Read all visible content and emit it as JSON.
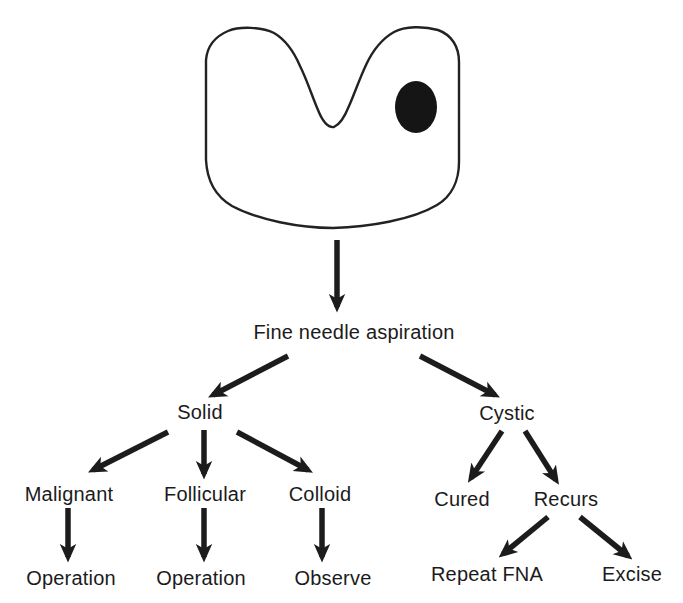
{
  "figure": {
    "shape": "thyroid-gland-with-nodule",
    "nodes": {
      "fna": "Fine needle aspiration",
      "solid": "Solid",
      "cystic": "Cystic",
      "malignant": "Malignant",
      "follicular": "Follicular",
      "colloid": "Colloid",
      "cured": "Cured",
      "recurs": "Recurs",
      "operation1": "Operation",
      "operation2": "Operation",
      "observe": "Observe",
      "repeat_fna": "Repeat FNA",
      "excise": "Excise"
    },
    "edges": [
      {
        "from": "thyroid",
        "to": "fna"
      },
      {
        "from": "fna",
        "to": "solid"
      },
      {
        "from": "fna",
        "to": "cystic"
      },
      {
        "from": "solid",
        "to": "malignant"
      },
      {
        "from": "solid",
        "to": "follicular"
      },
      {
        "from": "solid",
        "to": "colloid"
      },
      {
        "from": "malignant",
        "to": "operation1"
      },
      {
        "from": "follicular",
        "to": "operation2"
      },
      {
        "from": "colloid",
        "to": "observe"
      },
      {
        "from": "cystic",
        "to": "cured"
      },
      {
        "from": "cystic",
        "to": "recurs"
      },
      {
        "from": "recurs",
        "to": "repeat_fna"
      },
      {
        "from": "recurs",
        "to": "excise"
      }
    ],
    "colors": {
      "ink": "#1b1b1b",
      "background": "#ffffff"
    }
  }
}
